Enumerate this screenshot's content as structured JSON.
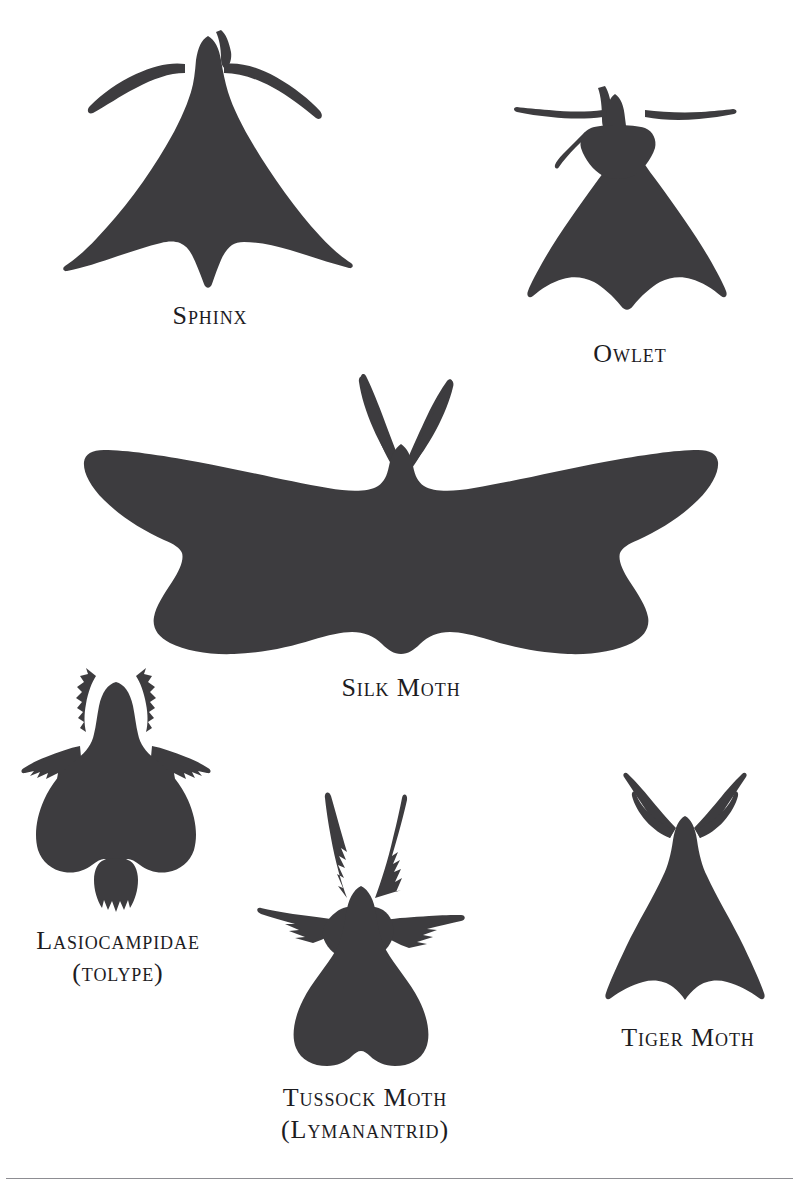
{
  "plate": {
    "title": "Moth silhouette identification plate",
    "background_color": "#ffffff",
    "silhouette_color": "#3d3c3f",
    "rule_color": "#8d8d92",
    "type": "illustration-plate"
  },
  "specimens": [
    {
      "id": "sphinx",
      "icon": "sphinx-moth-silhouette",
      "label_lines": [
        "Sphinx"
      ],
      "wing_shape": "long swept-back triangular wings with pointed abdomen",
      "antennae": "long slender tapered"
    },
    {
      "id": "owlet",
      "icon": "owlet-moth-silhouette",
      "label_lines": [
        "Owlet"
      ],
      "wing_shape": "broad tent-shaped triangle with rounded lower corners",
      "antennae": "fine horizontal filaments"
    },
    {
      "id": "silk-moth",
      "icon": "silk-moth-silhouette",
      "label_lines": [
        "Silk Moth"
      ],
      "wing_shape": "very wide scalloped wings spanning the plate",
      "antennae": "two broad feathered plumes in a V"
    },
    {
      "id": "lasiocampidae",
      "icon": "lasiocampidae-moth-silhouette",
      "label_lines": [
        "Lasiocampidae",
        "(tolype)"
      ],
      "wing_shape": "hairy rounded wings with shoulder tufts and furred abdomen",
      "antennae": "short tufted erect pair"
    },
    {
      "id": "tussock-moth",
      "icon": "tussock-moth-silhouette",
      "label_lines": [
        "Tussock Moth",
        "(Lymanantrid)"
      ],
      "wing_shape": "shaggy rounded wings with outstretched spiny legs",
      "antennae": "two large feathered plumes"
    },
    {
      "id": "tiger-moth",
      "icon": "tiger-moth-silhouette",
      "label_lines": [
        "Tiger Moth"
      ],
      "wing_shape": "narrow triangle with notched lower margin",
      "antennae": "slender curved pair forming a V"
    }
  ],
  "footer": {
    "divider": "horizontal-rule"
  }
}
